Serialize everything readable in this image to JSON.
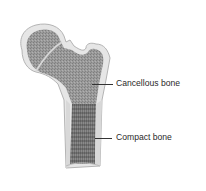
{
  "diagram": {
    "labels": [
      {
        "id": "cancellous",
        "text": "Cancellous bone"
      },
      {
        "id": "compact",
        "text": "Compact bone"
      }
    ],
    "colors": {
      "background": "#ffffff",
      "outer_cortex": "#e2e2e2",
      "cortex_edge": "#a8a8a8",
      "spongy": "#8f8f8f",
      "medullary": "#707070",
      "label_text": "#2a2a2a",
      "leader_line": "#333333"
    }
  }
}
